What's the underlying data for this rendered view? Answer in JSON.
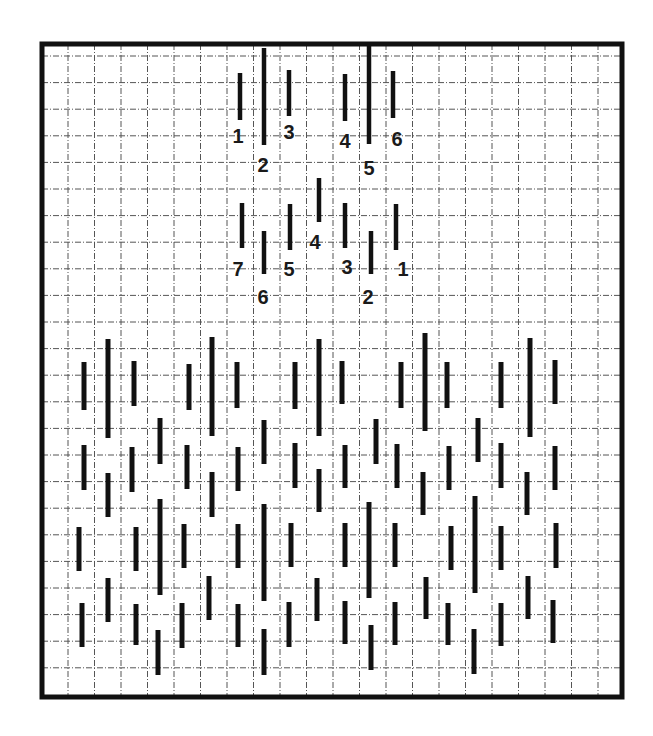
{
  "diagram": {
    "type": "stitch-chart",
    "colors": {
      "background": "#ffffff",
      "border": "#111111",
      "grid": "#555555",
      "stitch": "#111111",
      "label": "#1a1a1a"
    },
    "frame": {
      "x1": 42,
      "y1": 44,
      "x2": 622,
      "y2": 697,
      "stroke": 5
    },
    "grid": {
      "vertical_lines_x": [
        68,
        94.5,
        121,
        147.5,
        174,
        200.5,
        227,
        253.5,
        280,
        306.5,
        333,
        359.5,
        386,
        412.5,
        439,
        465.5,
        492,
        518.5,
        545,
        571.5,
        598
      ],
      "horizontal_lines_y": [
        56,
        82.6,
        109.2,
        135.8,
        162.4,
        189,
        215.6,
        242.2,
        268.8,
        295.4,
        322,
        348.6,
        375.2,
        401.8,
        428.4,
        455,
        481.6,
        508.2,
        534.8,
        561.4,
        588,
        614.6,
        641.2,
        667.8
      ]
    },
    "groups": [
      {
        "name": "top-left-sequence",
        "stitches": [
          {
            "label": "1",
            "x": 240,
            "y1": 73,
            "y2": 120,
            "lx": 238,
            "ly": 143
          },
          {
            "label": "2",
            "x": 264,
            "y1": 48,
            "y2": 145,
            "lx": 263,
            "ly": 172
          },
          {
            "label": "3",
            "x": 289,
            "y1": 70,
            "y2": 116,
            "lx": 289,
            "ly": 139
          }
        ]
      },
      {
        "name": "top-right-sequence",
        "stitches": [
          {
            "label": "4",
            "x": 345,
            "y1": 74,
            "y2": 121,
            "lx": 345,
            "ly": 148
          },
          {
            "label": "5",
            "x": 369,
            "y1": 45,
            "y2": 144,
            "lx": 369,
            "ly": 175
          },
          {
            "label": "6",
            "x": 393,
            "y1": 71,
            "y2": 118,
            "lx": 397,
            "ly": 146
          }
        ]
      },
      {
        "name": "middle-left-sequence",
        "stitches": [
          {
            "label": "7",
            "x": 242,
            "y1": 203,
            "y2": 248,
            "lx": 238,
            "ly": 276
          },
          {
            "label": "6",
            "x": 264,
            "y1": 231,
            "y2": 274,
            "lx": 263,
            "ly": 304
          },
          {
            "label": "5",
            "x": 290,
            "y1": 204,
            "y2": 250,
            "lx": 289,
            "ly": 276
          },
          {
            "label": "4",
            "x": 319,
            "y1": 178,
            "y2": 222,
            "lx": 315,
            "ly": 249
          }
        ]
      },
      {
        "name": "middle-right-sequence",
        "stitches": [
          {
            "label": "3",
            "x": 345,
            "y1": 203,
            "y2": 248,
            "lx": 347,
            "ly": 274
          },
          {
            "label": "2",
            "x": 371,
            "y1": 231,
            "y2": 274,
            "lx": 368,
            "ly": 304
          },
          {
            "label": "1",
            "x": 396,
            "y1": 204,
            "y2": 250,
            "lx": 403,
            "ly": 276
          }
        ]
      }
    ],
    "pattern_stitches": [
      {
        "x": 84,
        "y1": 362,
        "y2": 410
      },
      {
        "x": 108,
        "y1": 339,
        "y2": 438
      },
      {
        "x": 134,
        "y1": 361,
        "y2": 406
      },
      {
        "x": 189,
        "y1": 364,
        "y2": 410
      },
      {
        "x": 212,
        "y1": 337,
        "y2": 436
      },
      {
        "x": 237,
        "y1": 362,
        "y2": 408
      },
      {
        "x": 295,
        "y1": 362,
        "y2": 409
      },
      {
        "x": 319,
        "y1": 339,
        "y2": 436
      },
      {
        "x": 342,
        "y1": 361,
        "y2": 404
      },
      {
        "x": 401,
        "y1": 362,
        "y2": 408
      },
      {
        "x": 425,
        "y1": 333,
        "y2": 431
      },
      {
        "x": 447,
        "y1": 362,
        "y2": 408
      },
      {
        "x": 501,
        "y1": 362,
        "y2": 408
      },
      {
        "x": 530,
        "y1": 338,
        "y2": 437
      },
      {
        "x": 555,
        "y1": 360,
        "y2": 404
      },
      {
        "x": 160,
        "y1": 418,
        "y2": 464
      },
      {
        "x": 264,
        "y1": 420,
        "y2": 464
      },
      {
        "x": 376,
        "y1": 419,
        "y2": 464
      },
      {
        "x": 478,
        "y1": 418,
        "y2": 462
      },
      {
        "x": 84,
        "y1": 445,
        "y2": 490
      },
      {
        "x": 132,
        "y1": 447,
        "y2": 492
      },
      {
        "x": 187,
        "y1": 445,
        "y2": 489
      },
      {
        "x": 238,
        "y1": 447,
        "y2": 491
      },
      {
        "x": 295,
        "y1": 443,
        "y2": 488
      },
      {
        "x": 345,
        "y1": 445,
        "y2": 488
      },
      {
        "x": 397,
        "y1": 444,
        "y2": 488
      },
      {
        "x": 449,
        "y1": 446,
        "y2": 490
      },
      {
        "x": 501,
        "y1": 443,
        "y2": 488
      },
      {
        "x": 555,
        "y1": 446,
        "y2": 490
      },
      {
        "x": 108,
        "y1": 473,
        "y2": 517
      },
      {
        "x": 212,
        "y1": 472,
        "y2": 517
      },
      {
        "x": 319,
        "y1": 469,
        "y2": 512
      },
      {
        "x": 423,
        "y1": 472,
        "y2": 515
      },
      {
        "x": 527,
        "y1": 472,
        "y2": 515
      },
      {
        "x": 160,
        "y1": 499,
        "y2": 595
      },
      {
        "x": 264,
        "y1": 504,
        "y2": 601
      },
      {
        "x": 369,
        "y1": 502,
        "y2": 598
      },
      {
        "x": 475,
        "y1": 496,
        "y2": 593
      },
      {
        "x": 79,
        "y1": 527,
        "y2": 571
      },
      {
        "x": 136,
        "y1": 527,
        "y2": 571
      },
      {
        "x": 184,
        "y1": 524,
        "y2": 568
      },
      {
        "x": 238,
        "y1": 524,
        "y2": 568
      },
      {
        "x": 291,
        "y1": 523,
        "y2": 567
      },
      {
        "x": 345,
        "y1": 523,
        "y2": 567
      },
      {
        "x": 395,
        "y1": 523,
        "y2": 567
      },
      {
        "x": 451,
        "y1": 526,
        "y2": 570
      },
      {
        "x": 501,
        "y1": 526,
        "y2": 570
      },
      {
        "x": 556,
        "y1": 523,
        "y2": 568
      },
      {
        "x": 108,
        "y1": 578,
        "y2": 622
      },
      {
        "x": 209,
        "y1": 576,
        "y2": 620
      },
      {
        "x": 317,
        "y1": 578,
        "y2": 621
      },
      {
        "x": 426,
        "y1": 577,
        "y2": 619
      },
      {
        "x": 528,
        "y1": 576,
        "y2": 619
      },
      {
        "x": 82,
        "y1": 603,
        "y2": 647
      },
      {
        "x": 136,
        "y1": 604,
        "y2": 645
      },
      {
        "x": 182,
        "y1": 603,
        "y2": 648
      },
      {
        "x": 238,
        "y1": 604,
        "y2": 647
      },
      {
        "x": 289,
        "y1": 602,
        "y2": 647
      },
      {
        "x": 345,
        "y1": 601,
        "y2": 644
      },
      {
        "x": 395,
        "y1": 602,
        "y2": 645
      },
      {
        "x": 448,
        "y1": 603,
        "y2": 645
      },
      {
        "x": 501,
        "y1": 603,
        "y2": 646
      },
      {
        "x": 553,
        "y1": 600,
        "y2": 643
      },
      {
        "x": 158,
        "y1": 630,
        "y2": 675
      },
      {
        "x": 264,
        "y1": 629,
        "y2": 675
      },
      {
        "x": 371,
        "y1": 625,
        "y2": 670
      },
      {
        "x": 474,
        "y1": 629,
        "y2": 674
      }
    ]
  }
}
